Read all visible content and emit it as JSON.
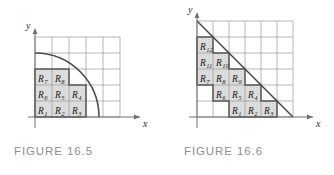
{
  "figures": [
    {
      "id": "figure-16-5",
      "caption": "FIGURE 16.5",
      "axis_x_label": "x",
      "axis_y_label": "y",
      "curve_type": "quarter-circle",
      "grid_cols": 5,
      "grid_rows": 5,
      "region_labels": [
        "R_1",
        "R_2",
        "R_3",
        "R_4",
        "R_5",
        "R_6",
        "R_7",
        "R_8"
      ],
      "cells": [
        {
          "name": "R",
          "sub": "1",
          "col": 0,
          "row": 0
        },
        {
          "name": "R",
          "sub": "2",
          "col": 1,
          "row": 0
        },
        {
          "name": "R",
          "sub": "3",
          "col": 2,
          "row": 0
        },
        {
          "name": "R",
          "sub": "4",
          "col": 2,
          "row": 1
        },
        {
          "name": "R",
          "sub": "5",
          "col": 1,
          "row": 1
        },
        {
          "name": "R",
          "sub": "6",
          "col": 0,
          "row": 1
        },
        {
          "name": "R",
          "sub": "7",
          "col": 0,
          "row": 2
        },
        {
          "name": "R",
          "sub": "8",
          "col": 1,
          "row": 2
        }
      ]
    },
    {
      "id": "figure-16-6",
      "caption": "FIGURE 16.6",
      "axis_x_label": "x",
      "axis_y_label": "y",
      "curve_type": "triangle-hypotenuse",
      "grid_cols": 6,
      "grid_rows": 6,
      "region_labels": [
        "R_1",
        "R_2",
        "R_3",
        "R_4",
        "R_5",
        "R_6",
        "R_7",
        "R_8",
        "R_9",
        "R_10",
        "R_11",
        "R_12"
      ],
      "cells": [
        {
          "name": "R",
          "sub": "1",
          "col": 2,
          "row": 0
        },
        {
          "name": "R",
          "sub": "2",
          "col": 3,
          "row": 0
        },
        {
          "name": "R",
          "sub": "3",
          "col": 4,
          "row": 0
        },
        {
          "name": "R",
          "sub": "4",
          "col": 3,
          "row": 1
        },
        {
          "name": "R",
          "sub": "5",
          "col": 2,
          "row": 1
        },
        {
          "name": "R",
          "sub": "6",
          "col": 1,
          "row": 1
        },
        {
          "name": "R",
          "sub": "7",
          "col": 0,
          "row": 2
        },
        {
          "name": "R",
          "sub": "8",
          "col": 1,
          "row": 2
        },
        {
          "name": "R",
          "sub": "9",
          "col": 2,
          "row": 2
        },
        {
          "name": "R",
          "sub": "10",
          "col": 1,
          "row": 3
        },
        {
          "name": "R",
          "sub": "11",
          "col": 0,
          "row": 3
        },
        {
          "name": "R",
          "sub": "12",
          "col": 0,
          "row": 4
        }
      ]
    }
  ],
  "colors": {
    "shade_fill": "#dcdcdc",
    "grid_line": "#9a9a9a",
    "axis_line": "#6f6f6f",
    "curve_line": "#4a4a4a",
    "caption_text": "#8e8e8e",
    "label_text": "#1a1a1a"
  },
  "chart_data": {
    "type": "diagram",
    "panels": [
      {
        "title": "FIGURE 16.5",
        "shape": "quarter circle of radius 5 in the first quadrant",
        "grid": "5 by 5 unit squares",
        "shaded_rectangle_count": 8,
        "shaded_rectangles": [
          "R_1",
          "R_2",
          "R_3",
          "R_4",
          "R_5",
          "R_6",
          "R_7",
          "R_8"
        ],
        "rows_from_bottom": [
          [
            "R_1",
            "R_2",
            "R_3"
          ],
          [
            "R_6",
            "R_5",
            "R_4"
          ],
          [
            "R_7",
            "R_8"
          ]
        ]
      },
      {
        "title": "FIGURE 16.6",
        "shape": "right triangle with hypotenuse from (0,6) to (6,0)",
        "grid": "6 by 6 unit squares",
        "shaded_rectangle_count": 12,
        "shaded_rectangles": [
          "R_1",
          "R_2",
          "R_3",
          "R_4",
          "R_5",
          "R_6",
          "R_7",
          "R_8",
          "R_9",
          "R_10",
          "R_11",
          "R_12"
        ],
        "rows_from_bottom": [
          [
            "R_1",
            "R_2",
            "R_3"
          ],
          [
            "R_6",
            "R_5",
            "R_4"
          ],
          [
            "R_7",
            "R_8",
            "R_9"
          ],
          [
            "R_11",
            "R_10"
          ],
          [
            "R_12"
          ]
        ]
      }
    ]
  }
}
